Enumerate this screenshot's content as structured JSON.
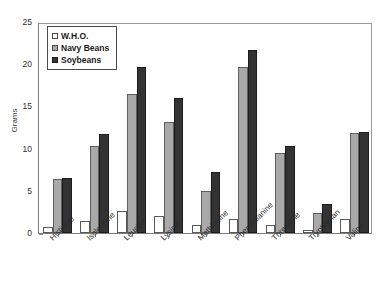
{
  "chart_data": {
    "type": "bar",
    "title": "",
    "xlabel": "",
    "ylabel": "Grams",
    "ylim": [
      0,
      25
    ],
    "yticks": [
      0,
      5,
      10,
      15,
      20,
      25
    ],
    "grid": false,
    "legend_position": "top-left",
    "categories": [
      "Histidine",
      "Isoleucine",
      "Leucine",
      "Lysine",
      "Methionine",
      "Phenylalanine",
      "Threonine",
      "Tryptophan",
      "Valine"
    ],
    "series": [
      {
        "name": "W.H.O.",
        "color": "#ffffff",
        "values": [
          0.7,
          1.4,
          2.6,
          2.0,
          0.9,
          1.7,
          1.0,
          0.35,
          1.7
        ]
      },
      {
        "name": "Navy Beans",
        "color": "#a9a9a9",
        "values": [
          6.4,
          10.3,
          16.5,
          13.1,
          5.0,
          19.7,
          9.5,
          2.4,
          11.9
        ]
      },
      {
        "name": "Soybeans",
        "color": "#333333",
        "values": [
          6.5,
          11.7,
          19.7,
          16.0,
          7.2,
          21.7,
          10.3,
          3.4,
          12.0
        ]
      }
    ]
  },
  "legend": {
    "items": [
      {
        "label": "W.H.O."
      },
      {
        "label": "Navy Beans"
      },
      {
        "label": "Soybeans"
      }
    ]
  },
  "axes": {
    "y_label": "Grams",
    "y_ticks": [
      "0",
      "5",
      "10",
      "15",
      "20",
      "25"
    ]
  }
}
